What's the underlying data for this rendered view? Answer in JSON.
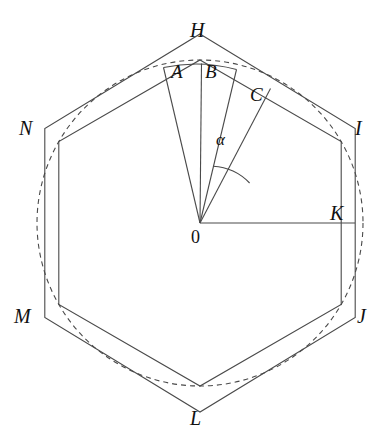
{
  "figure": {
    "kind": "geometry-diagram",
    "background_color": "#ffffff",
    "stroke_color": "#4a4a4a",
    "label_color": "#111111",
    "circle": {
      "style": "dashed",
      "center_label": "0",
      "center_x": 200,
      "center_y": 223,
      "radius": 163
    },
    "center_label": "0",
    "angle_label": "α",
    "sector_labels": [
      "A",
      "B",
      "C"
    ],
    "inscribed_hexagon": {
      "name": "inscribed-hexagon",
      "vertices_x": [
        200,
        341,
        341,
        200,
        59,
        59
      ],
      "vertices_y": [
        60,
        141,
        304,
        386,
        304,
        141
      ]
    },
    "circumscribed_hexagon": {
      "name": "circumscribed-hexagon",
      "vertex_labels": [
        "H",
        "I",
        "J",
        "L",
        "M",
        "N"
      ],
      "vertices_x": [
        200,
        355,
        355,
        200,
        45,
        45
      ],
      "vertices_y": [
        35,
        130,
        318,
        410,
        318,
        130
      ]
    },
    "radius_endpoint_label": "K",
    "vertex_labels": {
      "H": "H",
      "I": "I",
      "J": "J",
      "K": "K",
      "L": "L",
      "M": "M",
      "N": "N"
    },
    "cropped_header_text": ""
  }
}
